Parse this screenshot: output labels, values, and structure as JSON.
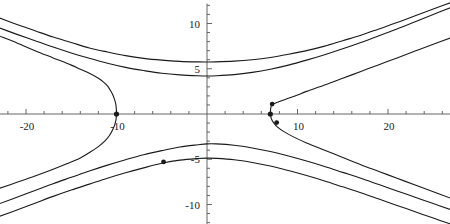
{
  "chart_data": {
    "type": "line",
    "title": "",
    "xlabel": "",
    "ylabel": "",
    "xlim": [
      -22.9,
      26.9
    ],
    "ylim": [
      -12.2,
      12.2
    ],
    "grid": false,
    "legend": null,
    "axes": {
      "origin_px": [
        207,
        114
      ],
      "scale_px_per_unit": 9.05,
      "x_ticks_major": [
        -20,
        -10,
        10,
        20
      ],
      "x_tick_labels": [
        "-20",
        "-10",
        "10",
        "20"
      ],
      "x_ticks_minor_step": 2,
      "y_ticks_major": [
        -10,
        -5,
        5,
        10
      ],
      "y_tick_labels": [
        "-10",
        "-5",
        "5",
        "10"
      ],
      "y_ticks_minor_step": 1,
      "axis_color": "#555555",
      "curve_color": "#1a1a1a"
    },
    "series": [
      {
        "name": "hyperbola-upper-outer",
        "comment": "upper branch, highest of the three upward curves; approaches y=5.8 near x=0",
        "points": [
          [
            -22.9,
            10.6
          ],
          [
            -21,
            9.9
          ],
          [
            -19,
            9.2
          ],
          [
            -17,
            8.5
          ],
          [
            -15,
            7.9
          ],
          [
            -13,
            7.3
          ],
          [
            -11,
            6.85
          ],
          [
            -9,
            6.45
          ],
          [
            -7,
            6.15
          ],
          [
            -5,
            5.95
          ],
          [
            -3,
            5.82
          ],
          [
            -1,
            5.76
          ],
          [
            0,
            5.75
          ],
          [
            1,
            5.76
          ],
          [
            3,
            5.84
          ],
          [
            5,
            6.0
          ],
          [
            7,
            6.25
          ],
          [
            9,
            6.6
          ],
          [
            11,
            7.0
          ],
          [
            13,
            7.5
          ],
          [
            15,
            8.1
          ],
          [
            17,
            8.7
          ],
          [
            19,
            9.4
          ],
          [
            21,
            10.1
          ],
          [
            23,
            10.85
          ],
          [
            25,
            11.6
          ],
          [
            26.9,
            12.3
          ]
        ]
      },
      {
        "name": "hyperbola-middle-upper",
        "comment": "second upward curve; minimum near y=4.2 just right of the y-axis",
        "points": [
          [
            -22.9,
            9.5
          ],
          [
            -21,
            8.8
          ],
          [
            -19,
            8.1
          ],
          [
            -17,
            7.4
          ],
          [
            -15,
            6.75
          ],
          [
            -13,
            6.15
          ],
          [
            -11,
            5.6
          ],
          [
            -9,
            5.15
          ],
          [
            -7,
            4.8
          ],
          [
            -5,
            4.5
          ],
          [
            -3,
            4.32
          ],
          [
            -1,
            4.22
          ],
          [
            0,
            4.2
          ],
          [
            1,
            4.22
          ],
          [
            3,
            4.35
          ],
          [
            5,
            4.6
          ],
          [
            7,
            4.95
          ],
          [
            9,
            5.4
          ],
          [
            11,
            5.95
          ],
          [
            13,
            6.55
          ],
          [
            15,
            7.2
          ],
          [
            17,
            7.9
          ],
          [
            19,
            8.65
          ],
          [
            21,
            9.4
          ],
          [
            23,
            10.2
          ],
          [
            25,
            11.0
          ],
          [
            26.9,
            11.75
          ]
        ]
      },
      {
        "name": "hyperbola-left-branch-upper",
        "comment": "left branch of the marked hyperbola, upper half, vertex marker at (-10,0)",
        "points": [
          [
            -22.9,
            8.6
          ],
          [
            -21,
            7.85
          ],
          [
            -19,
            7.0
          ],
          [
            -17,
            6.2
          ],
          [
            -15,
            5.4
          ],
          [
            -14,
            4.95
          ],
          [
            -13,
            4.5
          ],
          [
            -12,
            3.95
          ],
          [
            -11.4,
            3.5
          ],
          [
            -11,
            3.1
          ],
          [
            -10.7,
            2.65
          ],
          [
            -10.45,
            2.2
          ],
          [
            -10.25,
            1.7
          ],
          [
            -10.1,
            1.2
          ],
          [
            -10.03,
            0.7
          ],
          [
            -10.0,
            0.0
          ]
        ]
      },
      {
        "name": "hyperbola-left-branch-lower",
        "comment": "left branch lower half, continues down-left from vertex (-10,0)",
        "points": [
          [
            -10.0,
            0.0
          ],
          [
            -10.05,
            -0.6
          ],
          [
            -10.2,
            -1.2
          ],
          [
            -10.45,
            -1.8
          ],
          [
            -10.8,
            -2.4
          ],
          [
            -11.3,
            -3.0
          ],
          [
            -12.0,
            -3.6
          ],
          [
            -12.9,
            -4.2
          ],
          [
            -14,
            -4.85
          ],
          [
            -15.5,
            -5.5
          ],
          [
            -17,
            -6.1
          ],
          [
            -19,
            -6.85
          ],
          [
            -21,
            -7.55
          ],
          [
            -22.9,
            -8.2
          ]
        ]
      },
      {
        "name": "hyperbola-right-branch-upper",
        "comment": "right branch, upper half, with markers at (7.2,1.1) and (7.2,0.0)",
        "points": [
          [
            26.9,
            8.4
          ],
          [
            25,
            7.7
          ],
          [
            23,
            6.95
          ],
          [
            21,
            6.2
          ],
          [
            19,
            5.45
          ],
          [
            17,
            4.7
          ],
          [
            15,
            3.95
          ],
          [
            13,
            3.2
          ],
          [
            11,
            2.5
          ],
          [
            10,
            2.1
          ],
          [
            9,
            1.75
          ],
          [
            8.3,
            1.5
          ],
          [
            7.8,
            1.3
          ],
          [
            7.4,
            1.15
          ],
          [
            7.2,
            1.05
          ],
          [
            7.05,
            0.7
          ],
          [
            7.0,
            0.0
          ]
        ]
      },
      {
        "name": "hyperbola-right-branch-lower",
        "comment": "right branch lower half descending to the right, marker at (7.6,-0.9)",
        "points": [
          [
            7.0,
            0.0
          ],
          [
            7.1,
            -0.5
          ],
          [
            7.35,
            -0.95
          ],
          [
            7.8,
            -1.45
          ],
          [
            8.5,
            -1.95
          ],
          [
            9.5,
            -2.5
          ],
          [
            11,
            -3.2
          ],
          [
            13,
            -4.0
          ],
          [
            15,
            -4.8
          ],
          [
            17,
            -5.6
          ],
          [
            19,
            -6.35
          ],
          [
            21,
            -7.1
          ],
          [
            23,
            -7.85
          ],
          [
            25,
            -8.6
          ],
          [
            26.9,
            -9.3
          ]
        ]
      },
      {
        "name": "hyperbola-lower-middle",
        "comment": "lower middle curve, maximum near y=-3.2 at x=0",
        "points": [
          [
            -22.9,
            -9.9
          ],
          [
            -21,
            -9.2
          ],
          [
            -19,
            -8.45
          ],
          [
            -17,
            -7.7
          ],
          [
            -15,
            -7.0
          ],
          [
            -13,
            -6.3
          ],
          [
            -11,
            -5.65
          ],
          [
            -9,
            -5.05
          ],
          [
            -7,
            -4.5
          ],
          [
            -5,
            -4.05
          ],
          [
            -3,
            -3.65
          ],
          [
            -1,
            -3.4
          ],
          [
            0,
            -3.3
          ],
          [
            1,
            -3.3
          ],
          [
            3,
            -3.45
          ],
          [
            5,
            -3.75
          ],
          [
            7,
            -4.15
          ],
          [
            9,
            -4.65
          ],
          [
            11,
            -5.2
          ],
          [
            13,
            -5.8
          ],
          [
            15,
            -6.45
          ],
          [
            17,
            -7.1
          ],
          [
            19,
            -7.8
          ],
          [
            21,
            -8.5
          ],
          [
            23,
            -9.2
          ],
          [
            25,
            -9.9
          ],
          [
            26.9,
            -10.55
          ]
        ]
      },
      {
        "name": "hyperbola-lower-outer",
        "comment": "lowest curve, maximum near y=-4.9 just left of x=0, marker at (-4.8,-5.3)",
        "points": [
          [
            -22.9,
            -11.3
          ],
          [
            -21,
            -10.6
          ],
          [
            -19,
            -9.85
          ],
          [
            -17,
            -9.1
          ],
          [
            -15,
            -8.4
          ],
          [
            -13,
            -7.75
          ],
          [
            -11,
            -7.1
          ],
          [
            -9,
            -6.5
          ],
          [
            -7,
            -5.95
          ],
          [
            -5,
            -5.45
          ],
          [
            -3,
            -5.1
          ],
          [
            -1,
            -4.92
          ],
          [
            0,
            -4.88
          ],
          [
            1,
            -4.9
          ],
          [
            3,
            -5.05
          ],
          [
            5,
            -5.35
          ],
          [
            7,
            -5.75
          ],
          [
            9,
            -6.25
          ],
          [
            11,
            -6.8
          ],
          [
            13,
            -7.4
          ],
          [
            15,
            -8.05
          ],
          [
            17,
            -8.7
          ],
          [
            19,
            -9.4
          ],
          [
            21,
            -10.1
          ],
          [
            23,
            -10.8
          ],
          [
            25,
            -11.5
          ],
          [
            26.9,
            -12.15
          ]
        ]
      }
    ],
    "markers": [
      {
        "name": "vertex-left",
        "x": -10.0,
        "y": 0.0,
        "radius_px": 2.6
      },
      {
        "name": "point-lower-left",
        "x": -4.8,
        "y": -5.3,
        "radius_px": 2.4
      },
      {
        "name": "point-right-upper",
        "x": 7.2,
        "y": 1.1,
        "radius_px": 2.4
      },
      {
        "name": "vertex-right",
        "x": 7.0,
        "y": 0.0,
        "radius_px": 2.6
      },
      {
        "name": "point-right-lower",
        "x": 7.7,
        "y": -0.95,
        "radius_px": 2.4
      }
    ]
  }
}
